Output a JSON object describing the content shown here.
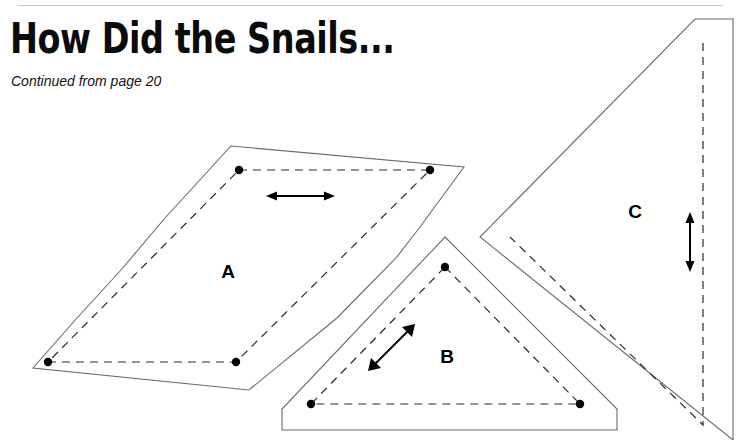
{
  "page": {
    "title": "How Did the Snails...",
    "subtitle": "Continued from page 20",
    "background_color": "#ffffff",
    "ink_color": "#000000",
    "rule_color": "#c9c9c9"
  },
  "templates": {
    "caption": "Quilt pattern templates",
    "pieces": [
      {
        "id": "A",
        "label": "A",
        "shape": "parallelogram",
        "grainline_arrow": "horizontal-double-headed",
        "seam_dots": 4,
        "label_x": 228,
        "label_y": 272
      },
      {
        "id": "B",
        "label": "B",
        "shape": "triangle",
        "grainline_arrow": "diagonal-double-headed",
        "seam_dots": 3,
        "label_x": 447,
        "label_y": 357
      },
      {
        "id": "C",
        "label": "C",
        "shape": "right-triangle",
        "grainline_arrow": "vertical-double-headed",
        "seam_dots": 0,
        "label_x": 635,
        "label_y": 212
      }
    ]
  },
  "geometry": {
    "piece_a": {
      "outline": "231,146 464,167 420,227 396,258 337,318 249,390 33,368 77,318 121,270 165,218",
      "seam": "239,170 430,170 236,362 48,362",
      "dots": [
        [
          239,
          170
        ],
        [
          430,
          170
        ],
        [
          236,
          362
        ],
        [
          48,
          362
        ]
      ],
      "arrow": {
        "x1": 266,
        "y1": 196,
        "x2": 335,
        "y2": 196
      }
    },
    "piece_b": {
      "outline": "445,237 617,409 617,430 282,430 282,409",
      "seam": "445,267 580,404 311,404",
      "dots": [
        [
          445,
          267
        ],
        [
          311,
          404
        ],
        [
          580,
          404
        ]
      ],
      "arrow": {
        "x1": 368,
        "y1": 371,
        "x2": 415,
        "y2": 324
      }
    },
    "piece_c": {
      "outline": "695,19 733,19 733,440 480,237",
      "seam": "703,43 703,425 510,237",
      "dots": [],
      "arrow": {
        "x1": 690,
        "y1": 212,
        "x2": 690,
        "y2": 272
      }
    }
  }
}
